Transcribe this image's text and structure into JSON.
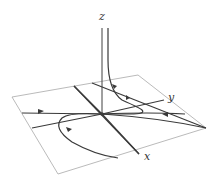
{
  "figure": {
    "type": "3d-phase-portrait",
    "axis_labels": {
      "x": "x",
      "y": "y",
      "z": "z"
    },
    "colors": {
      "plane": "#a8a8a8",
      "trajectory": "#3a3a3a",
      "background": "#ffffff"
    }
  }
}
